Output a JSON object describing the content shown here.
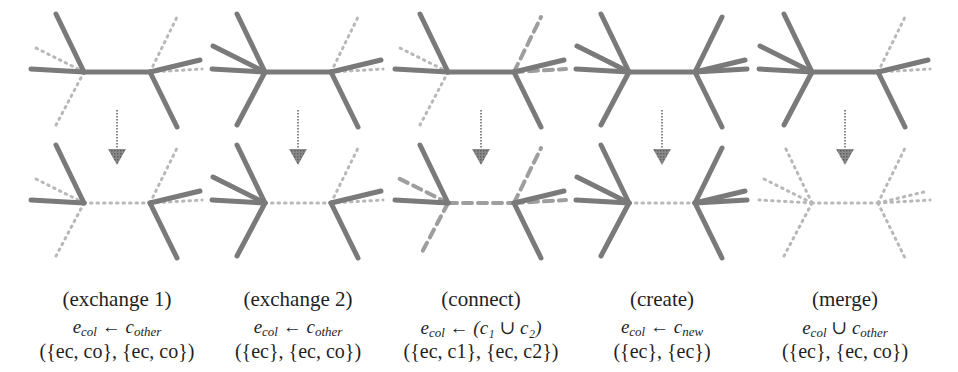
{
  "figure": {
    "colors": {
      "solid_edge": "#7a7a7a",
      "dotted_edge": "#b8b8b8",
      "arrow": "#888888"
    }
  },
  "panels": [
    {
      "id": "exchange1",
      "title": "(exchange 1)",
      "rule_lhs": "e",
      "rule_lhs_sub": "col",
      "rule_op": "←",
      "rule_rhs": "c",
      "rule_rhs_sub": "other",
      "sets": "({e_c, c_o}, {e_c, c_o})",
      "sets_display": "({ec, co}, {ec, co})"
    },
    {
      "id": "exchange2",
      "title": "(exchange 2)",
      "rule_lhs": "e",
      "rule_lhs_sub": "col",
      "rule_op": "←",
      "rule_rhs": "c",
      "rule_rhs_sub": "other",
      "sets": "({e_c}, {e_c, c_o})",
      "sets_display": "({ec}, {ec, co})"
    },
    {
      "id": "connect",
      "title": "(connect)",
      "rule_lhs": "e",
      "rule_lhs_sub": "col",
      "rule_op": "←",
      "rule_rhs": "(c₁ ∪ c₂)",
      "rule_rhs_sub": "",
      "sets": "({e_c, c_1}, {e_c, c_2})",
      "sets_display": "({ec, c1}, {ec, c2})"
    },
    {
      "id": "create",
      "title": "(create)",
      "rule_lhs": "e",
      "rule_lhs_sub": "col",
      "rule_op": "←",
      "rule_rhs": "c",
      "rule_rhs_sub": "new",
      "sets": "({e_c}, {e_c})",
      "sets_display": "({ec}, {ec})"
    },
    {
      "id": "merge",
      "title": "(merge)",
      "rule_lhs": "e",
      "rule_lhs_sub": "col",
      "rule_op": "∪",
      "rule_rhs": "c",
      "rule_rhs_sub": "other",
      "sets": "({e_c}, {e_c, c_o})",
      "sets_display": "({ec}, {ec, co})"
    }
  ]
}
